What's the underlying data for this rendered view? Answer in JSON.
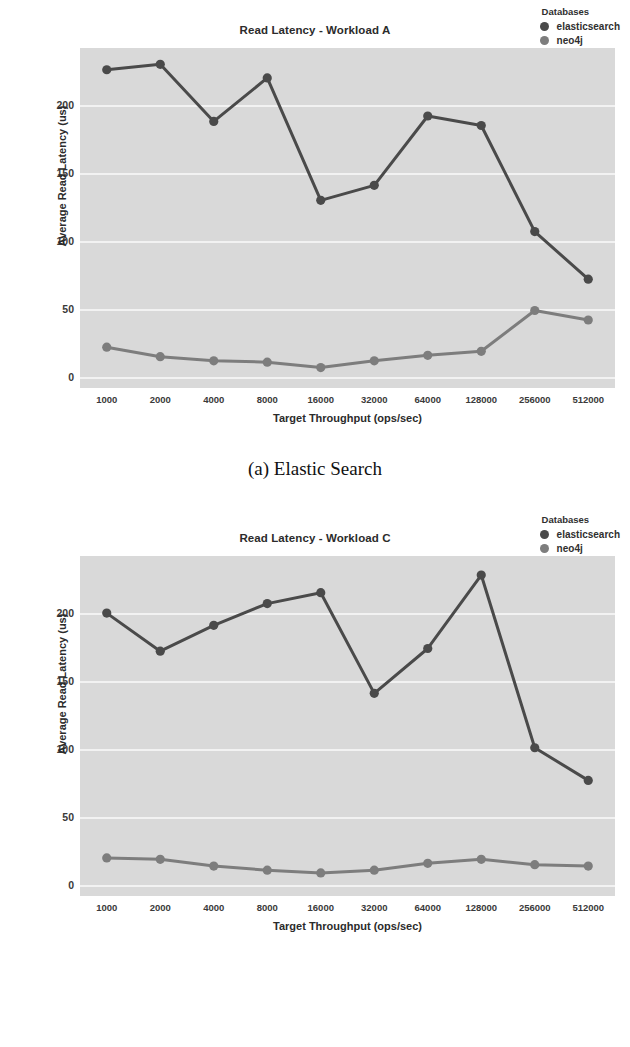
{
  "figures": [
    {
      "id": "a",
      "caption": "(a) Elastic Search",
      "chart_data": {
        "type": "line",
        "title": "Read Latency - Workload A",
        "xlabel": "Target Throughput (ops/sec)",
        "ylabel": "Average Read Latency (us)",
        "categories": [
          "1000",
          "2000",
          "4000",
          "8000",
          "16000",
          "32000",
          "64000",
          "128000",
          "256000",
          "512000"
        ],
        "yticks": [
          0,
          50,
          100,
          150,
          200
        ],
        "ylim": [
          -8,
          242
        ],
        "grid": true,
        "legend_title": "Databases",
        "legend_position": "upper right",
        "series": [
          {
            "name": "elasticsearch",
            "color": "#4a4a4a",
            "values": [
              226,
              230,
              188,
              220,
              130,
              141,
              192,
              185,
              107,
              72
            ]
          },
          {
            "name": "neo4j",
            "color": "#7d7d7d",
            "values": [
              22,
              15,
              12,
              11,
              7,
              12,
              16,
              19,
              49,
              42
            ]
          }
        ]
      }
    },
    {
      "id": "b",
      "caption": "(b) Neo4j",
      "chart_data": {
        "type": "line",
        "title": "Read Latency - Workload C",
        "xlabel": "Target Throughput (ops/sec)",
        "ylabel": "Average Read Latency (us)",
        "categories": [
          "1000",
          "2000",
          "4000",
          "8000",
          "16000",
          "32000",
          "64000",
          "128000",
          "256000",
          "512000"
        ],
        "yticks": [
          0,
          50,
          100,
          150,
          200
        ],
        "ylim": [
          -8,
          242
        ],
        "grid": true,
        "legend_title": "Databases",
        "legend_position": "upper right",
        "series": [
          {
            "name": "elasticsearch",
            "color": "#4a4a4a",
            "values": [
              200,
              172,
              191,
              207,
              215,
              141,
              174,
              228,
              101,
              77
            ]
          },
          {
            "name": "neo4j",
            "color": "#7d7d7d",
            "values": [
              20,
              19,
              14,
              11,
              9,
              11,
              16,
              19,
              15,
              14
            ]
          }
        ]
      }
    }
  ]
}
